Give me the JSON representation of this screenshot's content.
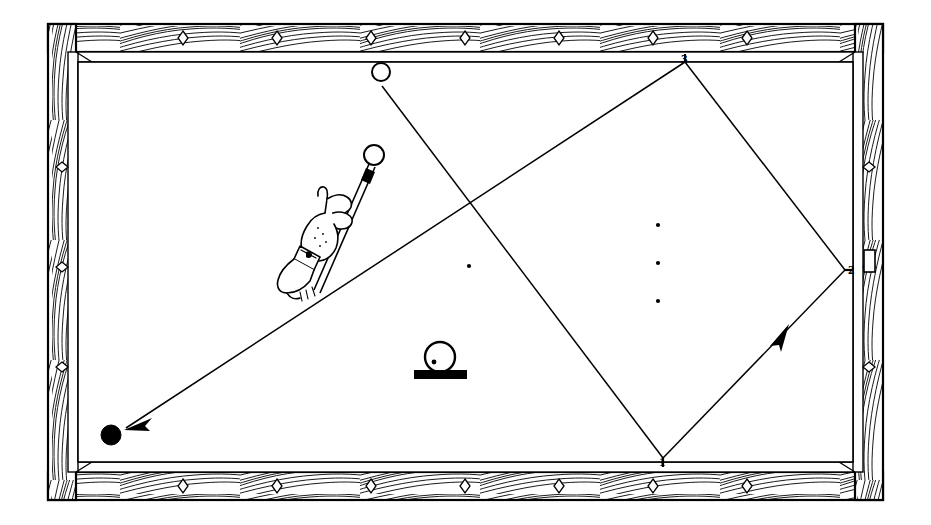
{
  "diagram": {
    "title": "Billiard table bank-shot diagram",
    "background_color": "#ffffff",
    "ink_color": "#000000",
    "table": {
      "frame_outer": {
        "x": 48,
        "y": 22,
        "width": 835,
        "height": 481
      },
      "playing_surface": {
        "x": 78,
        "y": 62,
        "width": 775,
        "height": 400
      },
      "rail_wood_grain": true,
      "diamonds": {
        "top_count": 7,
        "bottom_count": 7,
        "left_count": 3,
        "right_count": 3,
        "shape": "diamond"
      }
    },
    "balls": [
      {
        "name": "cue-ball-upper",
        "label": "",
        "cx": 381,
        "cy": 72,
        "r": 9,
        "fill": "white"
      },
      {
        "name": "cue-ball-struck",
        "label": "",
        "cx": 374,
        "cy": 155,
        "r": 10,
        "fill": "white"
      },
      {
        "name": "object-ball-black",
        "label": "",
        "cx": 111,
        "cy": 435,
        "r": 10,
        "fill": "black"
      },
      {
        "name": "spotted-ball-on-base",
        "label": "",
        "cx": 440,
        "cy": 359,
        "r": 14,
        "fill": "white"
      }
    ],
    "cushion_contacts": [
      {
        "label": "1",
        "x": 663,
        "y": 458,
        "rail": "bottom"
      },
      {
        "label": "2",
        "x": 845,
        "y": 270,
        "rail": "right"
      },
      {
        "label": "3",
        "x": 685,
        "y": 62,
        "rail": "top"
      }
    ],
    "table_spots": [
      {
        "x": 469,
        "y": 266
      },
      {
        "x": 658,
        "y": 225
      },
      {
        "x": 658,
        "y": 263
      },
      {
        "x": 658,
        "y": 301
      }
    ],
    "trajectory": {
      "description": "Cue ball travels from the start point down-right to cushion 1, rebounds up-right to cushion 2, rebounds up-left to cushion 3, then travels down-left to the black object ball.",
      "start": {
        "x": 382,
        "y": 86
      },
      "points": [
        {
          "x": 382,
          "y": 86
        },
        {
          "x": 663,
          "y": 458
        },
        {
          "x": 845,
          "y": 270
        },
        {
          "x": 685,
          "y": 62
        },
        {
          "x": 122,
          "y": 432
        }
      ],
      "arrow_heads": [
        {
          "at": {
            "x": 778,
            "y": 335
          },
          "direction": "up-right",
          "on_leg": 2
        },
        {
          "at": {
            "x": 122,
            "y": 432
          },
          "direction": "down-left",
          "on_leg": 4
        }
      ]
    },
    "player": {
      "hand": true,
      "cue_stick": true,
      "cue_tip_at_ball": {
        "x": 370,
        "y": 168
      }
    },
    "labels": {
      "one": "1",
      "two": "2",
      "three": "3"
    }
  }
}
